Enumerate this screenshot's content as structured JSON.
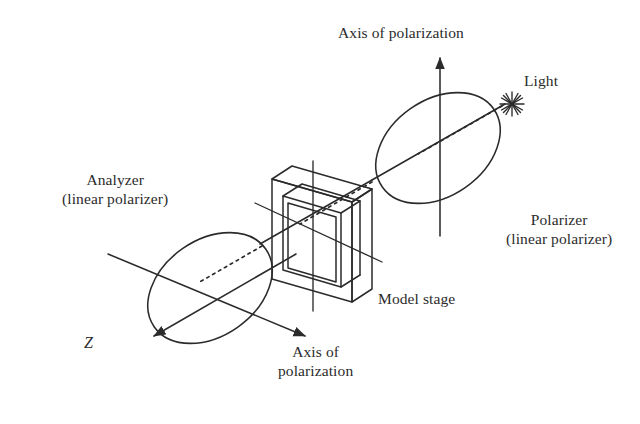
{
  "figure": {
    "background_color": "#ffffff",
    "line_color": "#2b2b2b",
    "text_color": "#2b2b2b"
  },
  "labels": {
    "axis_top": "Axis of polarization",
    "light": "Light",
    "polarizer_line1": "Polarizer",
    "polarizer_line2": "(linear polarizer)",
    "analyzer_line1": "Analyzer",
    "analyzer_line2": "(linear polarizer)",
    "model_stage": "Model stage",
    "z_axis": "Z",
    "axis_bottom_line1": "Axis of",
    "axis_bottom_line2": "polarization"
  },
  "components": [
    {
      "name": "light-source",
      "type": "starburst",
      "label": "Light",
      "position": {
        "x": 512,
        "y": 104
      }
    },
    {
      "name": "polarizer",
      "type": "ellipse",
      "label": "Polarizer (linear polarizer)",
      "center": {
        "x": 438,
        "y": 148
      },
      "radius_x": 68,
      "radius_y": 48,
      "rotation_deg": -35,
      "axis_of_polarization": "vertical"
    },
    {
      "name": "model-stage",
      "type": "isometric-frame",
      "label": "Model stage",
      "center": {
        "x": 315,
        "y": 225
      }
    },
    {
      "name": "analyzer",
      "type": "ellipse",
      "label": "Analyzer (linear polarizer)",
      "center": {
        "x": 210,
        "y": 288
      },
      "radius_x": 68,
      "radius_y": 48,
      "rotation_deg": -35,
      "axis_of_polarization": "oblique"
    }
  ],
  "arrows": [
    {
      "name": "axis-of-polarization-vertical",
      "from": {
        "x": 440,
        "y": 236
      },
      "to": {
        "x": 440,
        "y": 56
      }
    },
    {
      "name": "z-axis",
      "from": {
        "x": 296,
        "y": 254
      },
      "to": {
        "x": 152,
        "y": 337
      }
    },
    {
      "name": "axis-of-polarization-oblique",
      "from": {
        "x": 108,
        "y": 254
      },
      "to": {
        "x": 307,
        "y": 337
      }
    }
  ],
  "beam": {
    "name": "light-beam",
    "style": "dotted",
    "path": "from light source through polarizer, model stage, to analyzer"
  }
}
